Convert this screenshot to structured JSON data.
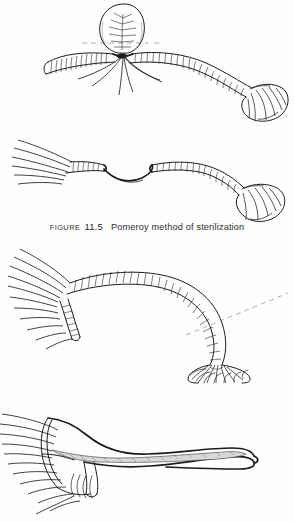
{
  "figure": {
    "caption_label": "FIGURE",
    "caption_number": "11.5",
    "caption_title": "Pomeroy method of sterilization",
    "caption_full": "FIGURE 11.5  Pomeroy method of sterilization",
    "background_color": "#fefefe",
    "ink_color": "#1c1c1c",
    "caption_text_color": "#2e2e2e",
    "guide_line_color": "#9a9a9a",
    "shading_color": "#d8d8d8"
  },
  "panels": [
    {
      "id": "panel-1",
      "name": "knuckle-ligated",
      "step": "1",
      "description": "Fallopian tube with a knuckle (loop) of tube elevated and ligated at its base with absorbable suture; suture ends trail downward; dashed guide line marks the level of the ligature.",
      "features": [
        "elevated tube loop",
        "ligature knot at loop base",
        "trailing suture strands",
        "dashed guide line",
        "fimbriated end at right",
        "isthmic segment at left"
      ]
    },
    {
      "id": "panel-2",
      "name": "loop-excised",
      "step": "2",
      "description": "The ligated knuckle has been excised, leaving two cut stumps of tube joined by the suture thread; fimbriae fan at left and right.",
      "features": [
        "two cut tube stumps",
        "dark suture thread between stumps",
        "mesosalpinx fan at left",
        "fimbriated infundibulum at right"
      ]
    },
    {
      "id": "panel-3",
      "name": "intact-tube",
      "step": "3",
      "description": "Intact fallopian tube curving from the mesosalpinx at left to the flared fimbrial end at lower right, with a dashed reference line crossing the ampulla.",
      "features": [
        "broad mesosalpinx fan at left",
        "segmented ampullary tube",
        "flared fimbrial trumpet at lower right",
        "dashed reference line",
        "short accessory branch"
      ]
    },
    {
      "id": "panel-4",
      "name": "clamped-tube",
      "step": "4",
      "description": "A surgical clamp grasps a segment of the tube; the shaded jaw tapers to a rounded tip at right; small suture loops hang below the mesosalpinx.",
      "features": [
        "clamp jaw with shaded interior",
        "rounded clamp tip",
        "mesosalpinx fan at left",
        "small suture loops below"
      ]
    }
  ]
}
